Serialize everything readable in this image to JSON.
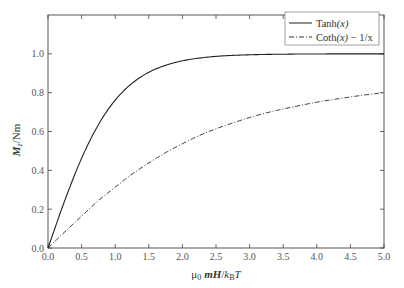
{
  "chart_data": {
    "type": "line",
    "title": "",
    "xlabel": "μ0 mH/kB T",
    "ylabel": "Mz/Nm",
    "xlim": [
      0,
      5.0
    ],
    "ylim": [
      0,
      1.2
    ],
    "grid": false,
    "legend_position": "upper right",
    "x_ticks": [
      "0.0",
      "0.5",
      "1.0",
      "1.5",
      "2.0",
      "2.5",
      "3.0",
      "3.5",
      "4.0",
      "4.5",
      "5.0"
    ],
    "y_ticks": [
      "0.0",
      "0.2",
      "0.4",
      "0.6",
      "0.8",
      "1.0"
    ],
    "x": [
      0,
      0.25,
      0.5,
      0.75,
      1.0,
      1.25,
      1.5,
      1.75,
      2.0,
      2.25,
      2.5,
      2.75,
      3.0,
      3.25,
      3.5,
      3.75,
      4.0,
      4.25,
      4.5,
      4.75,
      5.0
    ],
    "series": [
      {
        "name": "Tanh(x)",
        "style": "solid",
        "values": [
          0,
          0.245,
          0.462,
          0.635,
          0.762,
          0.848,
          0.905,
          0.941,
          0.964,
          0.978,
          0.987,
          0.992,
          0.995,
          0.997,
          0.998,
          0.999,
          0.999,
          1.0,
          1.0,
          1.0,
          1.0
        ]
      },
      {
        "name": "Coth(x) − 1/x",
        "style": "dash-dot",
        "values": [
          0,
          0.083,
          0.164,
          0.244,
          0.313,
          0.38,
          0.438,
          0.491,
          0.537,
          0.579,
          0.614,
          0.644,
          0.672,
          0.696,
          0.716,
          0.734,
          0.751,
          0.765,
          0.778,
          0.79,
          0.8
        ]
      }
    ]
  },
  "labels": {
    "ylabel_main": "M",
    "ylabel_sub": "z",
    "ylabel_rest": "/Nm",
    "xlabel_mu": "μ",
    "xlabel_mu_sub": "0",
    "xlabel_mH": "mH",
    "xlabel_slash": "/",
    "xlabel_k": "k",
    "xlabel_k_sub": "B",
    "xlabel_T": "T"
  },
  "legend": {
    "items": [
      {
        "prefix": "Tanh",
        "arg": "(x)",
        "suffix": ""
      },
      {
        "prefix": "Coth",
        "arg": "(x)",
        "suffix": " − 1/x"
      }
    ]
  }
}
